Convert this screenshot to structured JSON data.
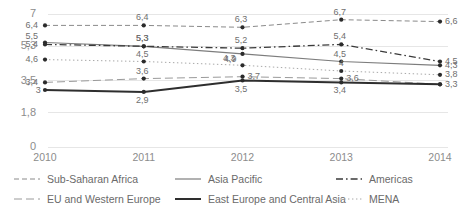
{
  "chart_data": {
    "type": "line",
    "title": "",
    "subtitle": "",
    "xlabel": "",
    "ylabel": "",
    "categories": [
      "2010",
      "2011",
      "2012",
      "2013",
      "2014"
    ],
    "x_tick_labels": [
      "2010",
      "2011",
      "2012",
      "2013",
      "2014"
    ],
    "y_tick_labels": [
      "7",
      "5,3",
      "3,5",
      "1,8",
      "0"
    ],
    "y_tick_values": [
      7,
      5.3,
      3.5,
      1.8,
      0
    ],
    "ylim": [
      0,
      7
    ],
    "grid": "horizontal",
    "legend_position": "bottom",
    "markers": true,
    "data_labels": true,
    "series": [
      {
        "name": "Sub-Saharan Africa",
        "style": "dashed",
        "color": "#8a8a8a",
        "width": 1,
        "values": [
          6.4,
          6.4,
          6.3,
          6.7,
          6.6
        ],
        "labels": [
          "6,4",
          "6,4",
          "6,3",
          "6,7",
          "6,6"
        ]
      },
      {
        "name": "Asia Pacific",
        "style": "solid-thin",
        "color": "#7d7d7d",
        "width": 1.2,
        "values": [
          5.5,
          5.3,
          4.9,
          4.5,
          4.3
        ],
        "labels": [
          "5,5",
          "5,3",
          "4,9",
          "4,5",
          "4,3"
        ]
      },
      {
        "name": "Americas",
        "style": "dash-dot",
        "color": "#3a3a3a",
        "width": 1.3,
        "values": [
          5.4,
          5.3,
          5.2,
          5.4,
          4.5
        ],
        "labels": [
          "5,4",
          "5,3",
          "5,2",
          "5,4",
          "4,5"
        ]
      },
      {
        "name": "EU and Western Europe",
        "style": "long-dash",
        "color": "#9a9a9a",
        "width": 1,
        "values": [
          3.4,
          3.6,
          3.7,
          3.6,
          3.3
        ],
        "labels": [
          "3,4",
          "3,6",
          "3,7",
          "3,6",
          "3,3"
        ]
      },
      {
        "name": "East Europe and Central Asia",
        "style": "solid-thick",
        "color": "#2e2e2e",
        "width": 2,
        "values": [
          3.0,
          2.9,
          3.5,
          3.4,
          3.3
        ],
        "labels": [
          "3",
          "2,9",
          "3,5",
          "3,4",
          "3,3"
        ]
      },
      {
        "name": "MENA",
        "style": "dotted",
        "color": "#a8a8a8",
        "width": 1,
        "values": [
          4.6,
          4.5,
          4.3,
          4.0,
          3.8
        ],
        "labels": [
          "4,6",
          "4,5",
          "4,3",
          "4",
          "3,8"
        ]
      }
    ]
  },
  "legend": {
    "items": [
      {
        "label": "Sub-Saharan Africa",
        "style": "dashed",
        "color": "#8a8a8a"
      },
      {
        "label": "Asia Pacific",
        "style": "solid-thin",
        "color": "#7d7d7d"
      },
      {
        "label": "Americas",
        "style": "dash-dot",
        "color": "#3a3a3a"
      },
      {
        "label": "EU and Western Europe",
        "style": "long-dash",
        "color": "#9a9a9a"
      },
      {
        "label": "East Europe and Central Asia",
        "style": "solid-thick",
        "color": "#2e2e2e"
      },
      {
        "label": "MENA",
        "style": "dotted",
        "color": "#a8a8a8"
      }
    ]
  },
  "colors": {
    "background": "#ffffff",
    "gridline": "#e6e6e6",
    "tick_text": "#8c8c8c",
    "label_text": "#6f6f6f",
    "legend_text": "#6a6a6a"
  }
}
